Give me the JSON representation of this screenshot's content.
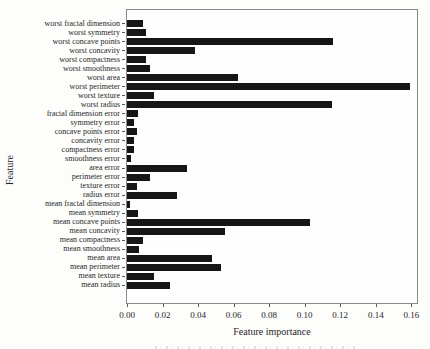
{
  "chart_data": {
    "type": "bar",
    "orientation": "horizontal",
    "title": "",
    "xlabel": "Feature importance",
    "ylabel": "Feature",
    "grid": false,
    "legend": null,
    "bar_color": "#161616",
    "spine_color": "#8a8a8a",
    "xlim": [
      0,
      0.1632
    ],
    "xticks": [
      0.0,
      0.02,
      0.04,
      0.06,
      0.08,
      0.1,
      0.12,
      0.14,
      0.16
    ],
    "xtick_labels": [
      "0.00",
      "0.02",
      "0.04",
      "0.06",
      "0.08",
      "0.10",
      "0.12",
      "0.14",
      "0.16"
    ],
    "categories": [
      "worst fractal dimension",
      "worst symmetry",
      "worst concave points",
      "worst concavity",
      "worst compactness",
      "worst smoothness",
      "worst area",
      "worst perimeter",
      "worst texture",
      "worst radius",
      "fractal dimension error",
      "symmetry error",
      "concave points error",
      "concavity error",
      "compactness error",
      "smoothness error",
      "area error",
      "perimeter error",
      "texture error",
      "radius error",
      "mean fractal dimension",
      "mean symmetry",
      "mean concave points",
      "mean concavity",
      "mean compactness",
      "mean smoothness",
      "mean area",
      "mean perimeter",
      "mean texture",
      "mean radius"
    ],
    "values": [
      0.009,
      0.0105,
      0.116,
      0.038,
      0.0105,
      0.013,
      0.0625,
      0.159,
      0.015,
      0.1155,
      0.006,
      0.004,
      0.0055,
      0.004,
      0.004,
      0.0025,
      0.0335,
      0.013,
      0.0055,
      0.028,
      0.0015,
      0.006,
      0.103,
      0.055,
      0.009,
      0.007,
      0.048,
      0.053,
      0.015,
      0.024
    ]
  }
}
